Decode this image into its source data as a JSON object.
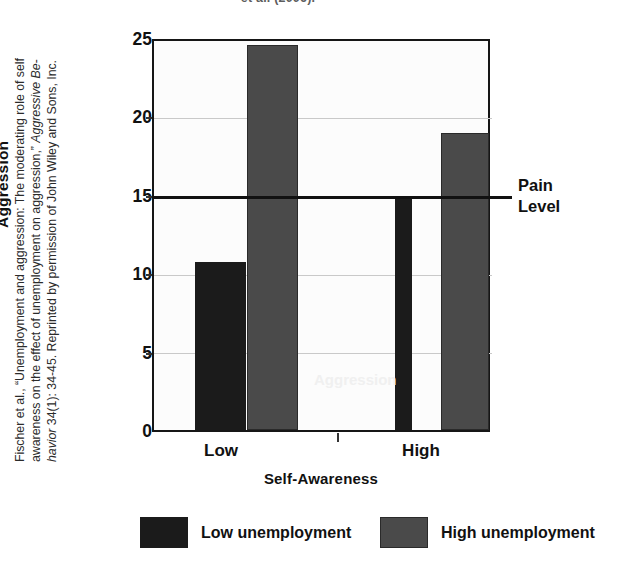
{
  "page": {
    "top_fragment": "et al. (2006).",
    "caption_line_1": "Fischer et al., “Unemployment and aggression: The moderating role of self",
    "caption_line_2": "awareness on the effect of unemployment on aggression,” Aggressive Be-",
    "caption_line_3": "havior 34(1): 34-45.  Reprinted by permission of John Wiley and Sons, Inc.",
    "caption_italic_1": "Aggressive Be-",
    "caption_italic_2": "havior"
  },
  "chart_data": {
    "type": "bar",
    "title": "",
    "xlabel": "Self-Awareness",
    "ylabel": "Aggression",
    "categories": [
      "Low",
      "High"
    ],
    "series": [
      {
        "name": "Low unemployment",
        "color": "#1b1b1b",
        "values": [
          10.7,
          14.8
        ]
      },
      {
        "name": "High unemployment",
        "color": "#4a4a4a",
        "values": [
          24.5,
          18.9
        ]
      }
    ],
    "ylim": [
      0,
      25
    ],
    "yticks": [
      0,
      5,
      10,
      15,
      20,
      25
    ],
    "ytick_labels": [
      "0",
      "5",
      "10",
      "15",
      "20",
      "25"
    ],
    "grid": true,
    "legend_position": "bottom",
    "annotations": [
      {
        "name": "pain-level",
        "label_line_1": "Pain",
        "label_line_2": "Level",
        "value": 15,
        "type": "horizontal-reference-line",
        "color": "#111111"
      }
    ]
  },
  "legend": {
    "items": [
      {
        "label": "Low unemployment",
        "swatch": "dark"
      },
      {
        "label": "High unemployment",
        "swatch": "gray"
      }
    ]
  },
  "axis": {
    "y_labels": [
      "25",
      "20",
      "15",
      "10",
      "5",
      "0"
    ],
    "x_labels": [
      "Low",
      "High"
    ],
    "y_title": "Aggression",
    "x_title": "Self-Awareness"
  },
  "pain": {
    "line1": "Pain",
    "line2": "Level"
  },
  "ghosts": {
    "g1": "Aggression",
    "g2": "Self-Awareness"
  }
}
